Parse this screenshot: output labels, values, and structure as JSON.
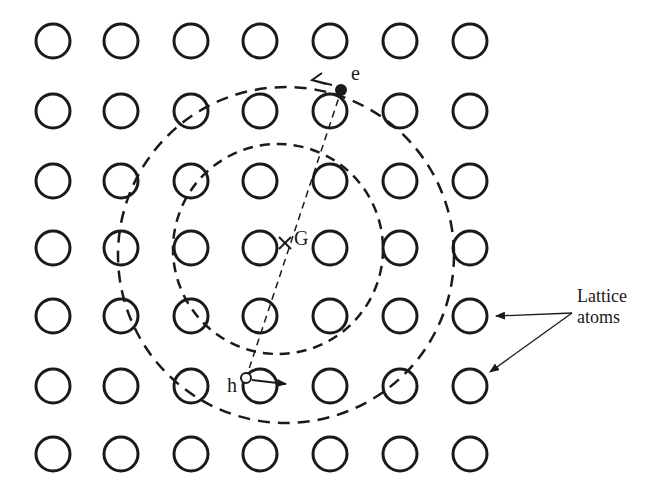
{
  "figure": {
    "lattice": {
      "rows": 7,
      "cols": 7
    },
    "labels": {
      "electron": "e",
      "hole": "h",
      "center_of_mass": "G",
      "lattice_line1": "Lattice",
      "lattice_line2": "atoms"
    },
    "colors": {
      "ink": "#1a1a1a",
      "background": "#ffffff"
    }
  }
}
